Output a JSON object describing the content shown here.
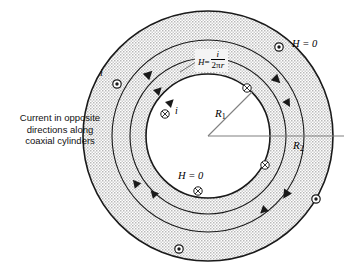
{
  "figure": {
    "caption": "Current in opposite\ndirections along\ncoaxial cylinders",
    "labels": {
      "h_zero_outer": "H = 0",
      "h_zero_inner": "H = 0",
      "current_outer": "i",
      "current_inner": "i",
      "radius_inner": "R",
      "radius_inner_sub": "1",
      "radius_outer": "R",
      "radius_outer_sub": "2",
      "field_symbol": "H",
      "field_equals": "=",
      "field_numerator": "i",
      "field_denominator_pi": "2π",
      "field_denominator_r": "r"
    },
    "colors": {
      "stroke": "#1a1a1a",
      "shade": "#d3d3d3",
      "shade_light": "#dcdcdc",
      "radius_line": "#808080",
      "leader_line": "#555555",
      "background": "#ffffff",
      "label_box": "#f4f4f4",
      "text": "#111111"
    },
    "geometry": {
      "center_x": 208,
      "center_y": 136,
      "r_inner": 62,
      "r_mid1": 78,
      "r_mid2": 96,
      "r_outer": 125
    },
    "current_symbols": [
      {
        "name": "dot-out-of-page",
        "glyph": "dot",
        "cx": 117,
        "cy": 84
      },
      {
        "name": "dot-out-of-page",
        "glyph": "dot",
        "cx": 279,
        "cy": 47
      },
      {
        "name": "dot-out-of-page",
        "glyph": "dot",
        "cx": 316,
        "cy": 199
      },
      {
        "name": "dot-out-of-page",
        "glyph": "dot",
        "cx": 179,
        "cy": 249
      },
      {
        "name": "cross-into-page",
        "glyph": "cross",
        "cx": 247,
        "cy": 88
      },
      {
        "name": "cross-into-page",
        "glyph": "cross",
        "cx": 165,
        "cy": 114
      },
      {
        "name": "cross-into-page",
        "glyph": "cross",
        "cx": 265,
        "cy": 165
      },
      {
        "name": "cross-into-page",
        "glyph": "cross",
        "cx": 198,
        "cy": 191
      }
    ],
    "field_direction": "counterclockwise"
  }
}
